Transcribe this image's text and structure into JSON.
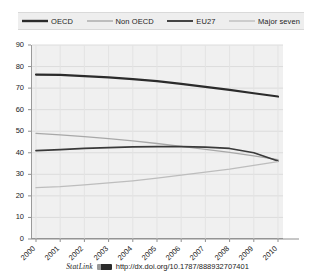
{
  "chart_data": {
    "type": "line",
    "title": "",
    "xlabel": "",
    "ylabel": "",
    "categories": [
      "2000",
      "2001",
      "2002",
      "2003",
      "2004",
      "2005",
      "2006",
      "2007",
      "2008",
      "2009",
      "2010"
    ],
    "ylim": [
      0,
      90
    ],
    "yticks": [
      0,
      10,
      20,
      30,
      40,
      50,
      60,
      70,
      80,
      90
    ],
    "grid": true,
    "legend_position": "top",
    "series": [
      {
        "name": "OECD",
        "color": "#2b2b2b",
        "width": 2.2,
        "values": [
          76.3,
          76.1,
          75.6,
          75.0,
          74.2,
          73.2,
          72.0,
          70.6,
          69.2,
          67.6,
          66.1
        ]
      },
      {
        "name": "Non OECD",
        "color": "#a8a8a8",
        "width": 1.3,
        "values": [
          49.0,
          48.3,
          47.5,
          46.6,
          45.5,
          44.3,
          43.0,
          41.6,
          40.2,
          38.6,
          36.8
        ]
      },
      {
        "name": "EU27",
        "color": "#3a3a3a",
        "width": 1.7,
        "values": [
          41.0,
          41.5,
          42.0,
          42.4,
          42.7,
          42.9,
          42.9,
          42.6,
          42.0,
          40.0,
          36.2
        ]
      },
      {
        "name": "Major seven",
        "color": "#bdbdbd",
        "width": 1.3,
        "values": [
          23.8,
          24.3,
          25.1,
          26.0,
          27.0,
          28.2,
          29.6,
          31.0,
          32.4,
          34.2,
          35.9
        ]
      }
    ]
  },
  "legend": {
    "items": [
      {
        "label": "OECD"
      },
      {
        "label": "Non OECD"
      },
      {
        "label": "EU27"
      },
      {
        "label": "Major seven"
      }
    ]
  },
  "footer": {
    "statlink_label": "StatLink",
    "statlink_icon": "statlink-barcode-icon",
    "url": "http://dx.doi.org/10.1787/888932707401"
  }
}
